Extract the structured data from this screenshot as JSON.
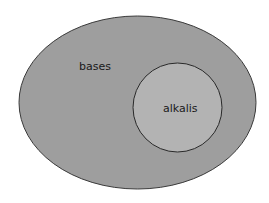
{
  "diagram": {
    "type": "venn-subset",
    "outer_set": {
      "label": "bases",
      "fill": "#9e9e9e",
      "stroke": "#3a3a3a"
    },
    "inner_set": {
      "label": "alkalis",
      "fill": "#b3b3b3",
      "stroke": "#2a2a2a"
    }
  }
}
